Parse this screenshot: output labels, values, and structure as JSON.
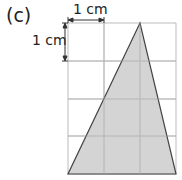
{
  "figure": {
    "part_label": "(c)",
    "scale_horizontal_label": "1 cm",
    "scale_vertical_label": "1 cm",
    "grid": {
      "columns": 3,
      "rows": 4,
      "cell_unit": "1 cm"
    },
    "shape": {
      "type": "triangle",
      "vertices_grid": [
        [
          2,
          0
        ],
        [
          0,
          4
        ],
        [
          3,
          4
        ]
      ],
      "fill": "#cccccc",
      "stroke": "#444444"
    },
    "grid_color": "#bbbbbb"
  }
}
